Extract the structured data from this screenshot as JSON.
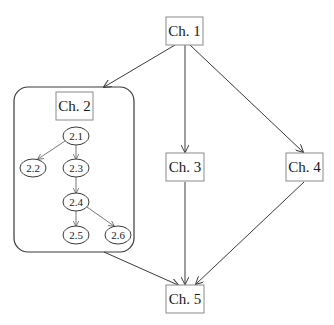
{
  "diagram": {
    "type": "chapter-dependency-graph",
    "nodes": {
      "ch1": "Ch. 1",
      "ch2": "Ch. 2",
      "ch3": "Ch. 3",
      "ch4": "Ch. 4",
      "ch5": "Ch. 5",
      "s21": "2.1",
      "s22": "2.2",
      "s23": "2.3",
      "s24": "2.4",
      "s25": "2.5",
      "s26": "2.6"
    },
    "edges": [
      [
        "Ch. 1",
        "Ch. 2"
      ],
      [
        "Ch. 1",
        "Ch. 3"
      ],
      [
        "Ch. 1",
        "Ch. 4"
      ],
      [
        "Ch. 2",
        "Ch. 5"
      ],
      [
        "Ch. 3",
        "Ch. 5"
      ],
      [
        "Ch. 4",
        "Ch. 5"
      ],
      [
        "2.1",
        "2.2"
      ],
      [
        "2.1",
        "2.3"
      ],
      [
        "2.3",
        "2.4"
      ],
      [
        "2.4",
        "2.5"
      ],
      [
        "2.4",
        "2.6"
      ]
    ],
    "colors": {
      "stroke": "#3a3a3a",
      "box_stroke": "#8a8a8a",
      "background": "#ffffff"
    }
  }
}
